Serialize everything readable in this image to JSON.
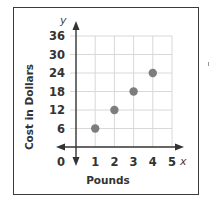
{
  "chart_data": {
    "type": "scatter",
    "title": "",
    "xlabel": "Pounds",
    "ylabel": "Cost in Dollars",
    "x_var": "x",
    "y_var": "y",
    "x": [
      1,
      2,
      3,
      4
    ],
    "y": [
      6,
      12,
      18,
      24
    ],
    "series": [
      {
        "name": "Cost",
        "x": [
          1,
          2,
          3,
          4
        ],
        "y": [
          6,
          12,
          18,
          24
        ]
      }
    ],
    "x_ticks": [
      "0",
      "1",
      "2",
      "3",
      "4",
      "5"
    ],
    "y_ticks": [
      "6",
      "12",
      "18",
      "24",
      "30",
      "36"
    ],
    "xlim": [
      0,
      5
    ],
    "ylim": [
      0,
      36
    ],
    "grid": true,
    "legend": "none",
    "colors": {
      "point": "#7d7d7d",
      "axis": "#333333",
      "grid": "#d8d8d8"
    }
  }
}
